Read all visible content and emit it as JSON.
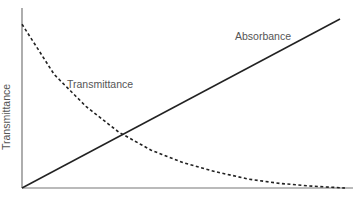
{
  "chart_data": {
    "type": "line",
    "title": "",
    "xlabel": "",
    "ylabel": "Transmittance",
    "grid": false,
    "legend": "inline labels",
    "series": [
      {
        "name": "Absorbance",
        "style": "solid",
        "color": "#222222",
        "shape": "linear increasing",
        "x": [
          0,
          0.25,
          0.5,
          0.75,
          1.0
        ],
        "values": [
          0,
          0.23,
          0.47,
          0.7,
          0.94
        ]
      },
      {
        "name": "Transmittance",
        "style": "dashed",
        "color": "#222222",
        "shape": "exponential decay",
        "x": [
          0,
          0.1,
          0.2,
          0.3,
          0.4,
          0.5,
          0.6,
          0.7,
          0.8,
          0.9,
          1.0
        ],
        "values": [
          0.91,
          0.63,
          0.45,
          0.31,
          0.21,
          0.14,
          0.09,
          0.05,
          0.025,
          0.01,
          0.0
        ]
      }
    ],
    "annotations": [
      {
        "text": "Absorbance",
        "near_series": "Absorbance"
      },
      {
        "text": "Transmittance",
        "near_series": "Transmittance"
      }
    ]
  },
  "labels": {
    "y_axis": "Transmittance",
    "absorbance": "Absorbance",
    "transmittance": "Transmittance"
  }
}
